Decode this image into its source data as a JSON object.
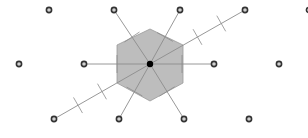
{
  "diagram": {
    "colors": {
      "cell_fill": "#bdbdbd",
      "cell_stroke": "#9a9a9a",
      "line": "#8c8c8c",
      "point_ring": "#333333",
      "point_center": "#d0d0d0",
      "origin": "#000000"
    },
    "origin": {
      "x": 150,
      "y": 64
    },
    "lattice_points": [
      {
        "x": 49,
        "y": 10
      },
      {
        "x": 114,
        "y": 10
      },
      {
        "x": 180,
        "y": 10
      },
      {
        "x": 245,
        "y": 10
      },
      {
        "x": 309,
        "y": 10
      },
      {
        "x": 19,
        "y": 64
      },
      {
        "x": 84,
        "y": 64
      },
      {
        "x": 214,
        "y": 64
      },
      {
        "x": 279,
        "y": 64
      },
      {
        "x": 54,
        "y": 119
      },
      {
        "x": 119,
        "y": 119
      },
      {
        "x": 184,
        "y": 119
      },
      {
        "x": 249,
        "y": 119
      }
    ],
    "connected_neighbors": [
      {
        "x": 114,
        "y": 10
      },
      {
        "x": 180,
        "y": 10
      },
      {
        "x": 245,
        "y": 10
      },
      {
        "x": 84,
        "y": 64
      },
      {
        "x": 214,
        "y": 64
      },
      {
        "x": 54,
        "y": 119
      },
      {
        "x": 119,
        "y": 119
      },
      {
        "x": 184,
        "y": 119
      }
    ],
    "hexagon": [
      {
        "x": 150,
        "y": 29
      },
      {
        "x": 183,
        "y": 45
      },
      {
        "x": 183,
        "y": 83
      },
      {
        "x": 150,
        "y": 101
      },
      {
        "x": 117,
        "y": 83
      },
      {
        "x": 117,
        "y": 45
      }
    ]
  }
}
